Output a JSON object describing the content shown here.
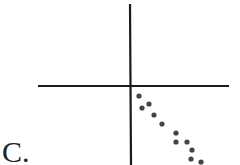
{
  "figure": {
    "panel_label": "C."
  },
  "chart_data": {
    "type": "scatter",
    "title": "",
    "xlabel": "",
    "ylabel": "",
    "grid": false,
    "axes": "crosshair through origin, no ticks",
    "legend": null,
    "points_pixel": [
      [
        139,
        96
      ],
      [
        142,
        108
      ],
      [
        149,
        104
      ],
      [
        154,
        115
      ],
      [
        162,
        124
      ],
      [
        176,
        133
      ],
      [
        176,
        142
      ],
      [
        187,
        142
      ],
      [
        192,
        150
      ],
      [
        191,
        159
      ],
      [
        201,
        162
      ]
    ],
    "origin_pixel": [
      130,
      86
    ],
    "x": [
      0.09,
      0.12,
      0.19,
      0.24,
      0.32,
      0.46,
      0.46,
      0.57,
      0.62,
      0.61,
      0.71
    ],
    "y": [
      -0.1,
      -0.22,
      -0.18,
      -0.29,
      -0.38,
      -0.47,
      -0.56,
      -0.56,
      -0.64,
      -0.73,
      -0.76
    ],
    "point_color": "#444444",
    "axis_color": "#1a1a1a"
  }
}
